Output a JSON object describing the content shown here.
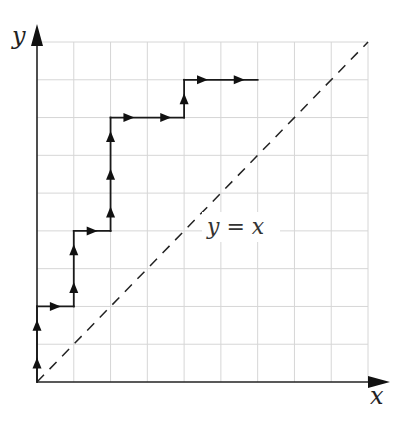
{
  "diagram": {
    "type": "lattice-path",
    "grid": {
      "cols": 9,
      "rows": 9
    },
    "axes": {
      "x_label": "x",
      "y_label": "y"
    },
    "diagonal": {
      "label": "y = x",
      "from": [
        0,
        0
      ],
      "to": [
        9,
        9
      ],
      "style": "dashed"
    },
    "path": {
      "start": [
        0,
        0
      ],
      "moves": [
        "U",
        "U",
        "R",
        "U",
        "U",
        "R",
        "U",
        "U",
        "U",
        "R",
        "R",
        "U",
        "R",
        "R"
      ],
      "vertices": [
        [
          0,
          0
        ],
        [
          0,
          2
        ],
        [
          1,
          2
        ],
        [
          1,
          4
        ],
        [
          2,
          4
        ],
        [
          2,
          7
        ],
        [
          4,
          7
        ],
        [
          4,
          8
        ],
        [
          6,
          8
        ]
      ]
    },
    "colors": {
      "grid": "#d6d6d6",
      "ink": "#1a1a1a",
      "background": "#ffffff"
    }
  }
}
